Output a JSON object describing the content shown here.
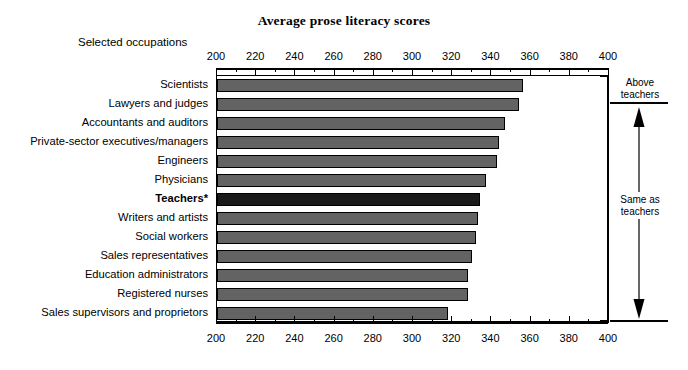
{
  "chart_data": {
    "type": "bar",
    "orientation": "horizontal",
    "title": "Average prose literacy scores",
    "xlabel": "",
    "ylabel": "Selected occupations",
    "xlim": [
      200,
      400
    ],
    "xticks": [
      200,
      220,
      240,
      260,
      280,
      300,
      320,
      340,
      360,
      380,
      400
    ],
    "xtick_labels": [
      "200",
      "220",
      "240",
      "260",
      "280",
      "300",
      "320",
      "340",
      "360",
      "380",
      "400"
    ],
    "minor_tick_step": 10,
    "grid": false,
    "legend": "none",
    "categories": [
      "Scientists",
      "Lawyers and judges",
      "Accountants and auditors",
      "Private-sector executives/managers",
      "Engineers",
      "Physicians",
      "Teachers*",
      "Writers and artists",
      "Social workers",
      "Sales representatives",
      "Education administrators",
      "Registered nurses",
      "Sales supervisors and proprietors"
    ],
    "values": [
      356,
      354,
      347,
      344,
      343,
      337,
      334,
      333,
      332,
      330,
      328,
      328,
      318
    ],
    "highlight_category": "Teachers*",
    "bar_color": "#636363",
    "highlight_color": "#1a1a1a",
    "bar_edge_color": "#000000",
    "annotations": [
      {
        "name": "above-teachers",
        "text": "Above\nteachers",
        "line1": "Above",
        "line2": "teachers"
      },
      {
        "name": "same-as-teachers",
        "text": "Same as\nteachers",
        "line1": "Same as",
        "line2": "teachers"
      }
    ]
  },
  "title": "Average prose literacy scores",
  "axis_name": "Selected occupations",
  "side_panel": {
    "above_line1": "Above",
    "above_line2": "teachers",
    "same_line1": "Same as",
    "same_line2": "teachers"
  }
}
